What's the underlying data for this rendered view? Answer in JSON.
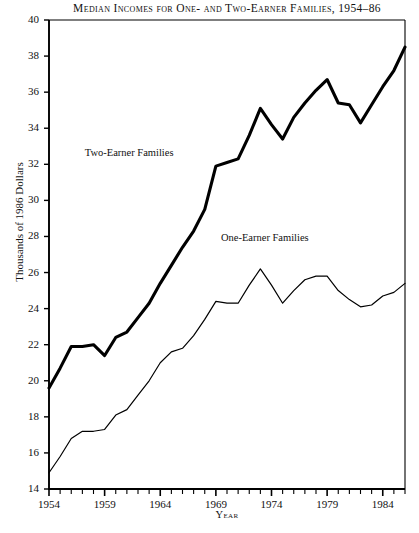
{
  "chart_data": {
    "type": "line",
    "title": "Median Incomes for One- and Two-Earner Families, 1954–86",
    "xlabel": "Year",
    "ylabel": "Thousands of 1986 Dollars",
    "xlim": [
      1954,
      1986
    ],
    "ylim": [
      14,
      40
    ],
    "ytick_step": 2,
    "xtick_minor_step": 1,
    "xtick_major_step": 5,
    "grid": false,
    "legend_position": "inline-annotations",
    "ytick_labels": [
      "14",
      "16",
      "18",
      "20",
      "22",
      "24",
      "26",
      "28",
      "30",
      "32",
      "34",
      "36",
      "38",
      "40"
    ],
    "ytick_values": [
      14,
      16,
      18,
      20,
      22,
      24,
      26,
      28,
      30,
      32,
      34,
      36,
      38,
      40
    ],
    "xtick_labels": [
      "1954",
      "1959",
      "1964",
      "1969",
      "1974",
      "1979",
      "1984"
    ],
    "xtick_values": [
      1954,
      1959,
      1964,
      1969,
      1974,
      1979,
      1984
    ],
    "x": [
      1954,
      1955,
      1956,
      1957,
      1958,
      1959,
      1960,
      1961,
      1962,
      1963,
      1964,
      1965,
      1966,
      1967,
      1968,
      1969,
      1970,
      1971,
      1972,
      1973,
      1974,
      1975,
      1976,
      1977,
      1978,
      1979,
      1980,
      1981,
      1982,
      1983,
      1984,
      1985,
      1986
    ],
    "series": [
      {
        "name": "Two-Earner Families",
        "style": "thick",
        "color": "#000000",
        "line_width": 3.1,
        "label_x": 1961.2,
        "label_y": 32.6,
        "values": [
          19.6,
          20.7,
          21.9,
          21.9,
          22.0,
          21.4,
          22.4,
          22.7,
          23.5,
          24.3,
          25.4,
          26.4,
          27.4,
          28.3,
          29.5,
          31.9,
          32.1,
          32.3,
          33.6,
          35.1,
          34.2,
          33.4,
          34.6,
          35.4,
          36.1,
          36.7,
          35.4,
          35.3,
          34.3,
          35.3,
          36.3,
          37.2,
          38.5
        ]
      },
      {
        "name": "One-Earner Families",
        "style": "thin",
        "color": "#000000",
        "line_width": 1.2,
        "label_x": 1973.4,
        "label_y": 27.9,
        "values": [
          14.9,
          15.8,
          16.8,
          17.2,
          17.2,
          17.3,
          18.1,
          18.4,
          19.2,
          20.0,
          21.0,
          21.6,
          21.8,
          22.5,
          23.4,
          24.4,
          24.3,
          24.3,
          25.3,
          26.2,
          25.3,
          24.3,
          25.0,
          25.6,
          25.8,
          25.8,
          25.0,
          24.5,
          24.1,
          24.2,
          24.7,
          24.9,
          25.4
        ]
      }
    ]
  }
}
